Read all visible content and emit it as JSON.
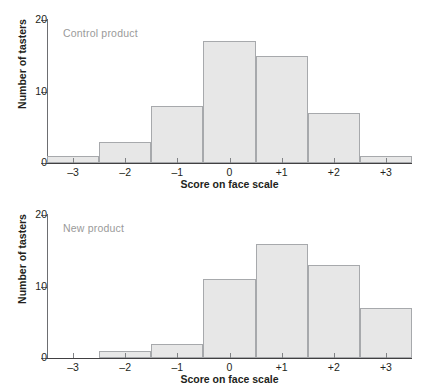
{
  "figure": {
    "background": "#ffffff",
    "bar_fill": "#e7e7e7",
    "bar_stroke": "#a7a9ac",
    "subtitle_color": "#9a9a9a",
    "axis_color": "#414042"
  },
  "chart_data": [
    {
      "type": "bar",
      "title": "Control product",
      "xlabel": "Score on face scale",
      "ylabel": "Number of tasters",
      "categories": [
        "-3",
        "-2",
        "-1",
        "0",
        "+1",
        "+2",
        "+3"
      ],
      "values": [
        1,
        3,
        8,
        17,
        15,
        7,
        1
      ],
      "ylim": [
        0,
        20
      ],
      "yticks": [
        0,
        10,
        20
      ],
      "ytick_labels": [
        "0",
        "10",
        "20"
      ],
      "grid": false,
      "legend": "none"
    },
    {
      "type": "bar",
      "title": "New product",
      "xlabel": "Score on face scale",
      "ylabel": "Number of tasters",
      "categories": [
        "-3",
        "-2",
        "-1",
        "0",
        "+1",
        "+2",
        "+3"
      ],
      "values": [
        0,
        1,
        2,
        11,
        16,
        13,
        7
      ],
      "ylim": [
        0,
        20
      ],
      "yticks": [
        0,
        10,
        20
      ],
      "ytick_labels": [
        "0",
        "10",
        "20"
      ],
      "grid": false,
      "legend": "none"
    }
  ]
}
